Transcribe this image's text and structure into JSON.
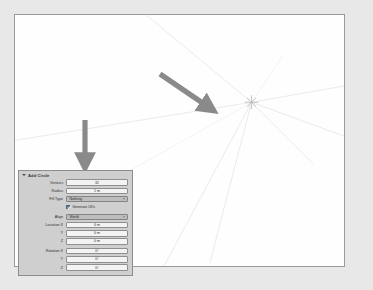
{
  "viewport": {
    "name": "3d-viewport",
    "background": "#fefefe",
    "border_color": "#9a9a9a",
    "grid_color": "#e2e2e2",
    "cursor_label": "3d-cursor"
  },
  "annotations": {
    "color": "#8a8a8a",
    "arrows": [
      {
        "name": "arrow-pointing-to-cursor",
        "direction": "down-right"
      },
      {
        "name": "arrow-pointing-to-panel",
        "direction": "down"
      }
    ]
  },
  "redo_panel": {
    "title": "Add Circle",
    "collapse_icon": "triangle-down-icon",
    "rows": [
      {
        "label": "Vertices",
        "value": "32",
        "type": "number"
      },
      {
        "label": "Radius",
        "value": "1 m",
        "type": "number"
      },
      {
        "label": "Fill Type",
        "value": "Nothing",
        "type": "dropdown"
      }
    ],
    "checkbox": {
      "label": "Generate UVs",
      "checked": true
    },
    "align": {
      "label": "Align",
      "value": "World",
      "type": "dropdown"
    },
    "location": [
      {
        "label": "Location X",
        "value": "0 m"
      },
      {
        "label": "Y",
        "value": "0 m"
      },
      {
        "label": "Z",
        "value": "0 m"
      }
    ],
    "rotation": [
      {
        "label": "Rotation X",
        "value": "0°"
      },
      {
        "label": "Y",
        "value": "0°"
      },
      {
        "label": "Z",
        "value": "0°"
      }
    ]
  }
}
